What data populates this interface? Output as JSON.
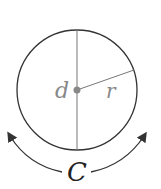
{
  "diagram": {
    "labels": {
      "diameter": "d",
      "radius": "r",
      "circumference": "C"
    },
    "colors": {
      "stroke": "#333333",
      "inner_lines": "#777777",
      "label_gray": "#888888",
      "label_dark": "#222222",
      "center_dot": "#888888"
    }
  }
}
